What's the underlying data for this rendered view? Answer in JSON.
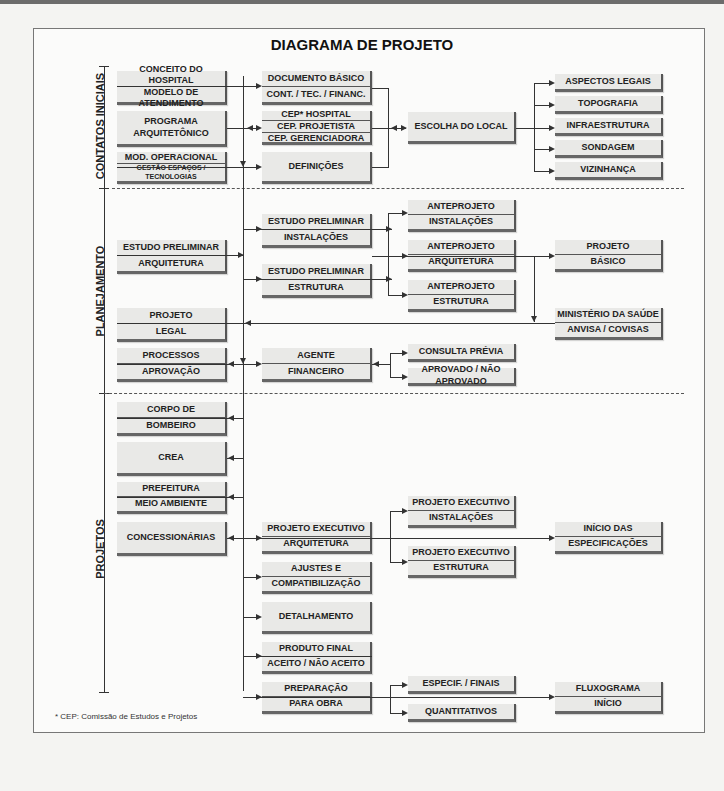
{
  "title": "DIAGRAMA DE PROJETO",
  "phases": [
    {
      "label": "CONTATOS INICIAIS"
    },
    {
      "label": "PLANEJAMENTO"
    },
    {
      "label": "PROJETOS"
    }
  ],
  "boxes": {
    "conceito": [
      "CONCEITO DO HOSPITAL",
      "MODELO DE ATENDIMENTO"
    ],
    "programa": [
      "PROGRAMA",
      "ARQUITETÔNICO"
    ],
    "mod_operacional": [
      "MOD. OPERACIONAL",
      "GESTÃO ESPAÇOS / TECNOLOGIAS"
    ],
    "documento_basico": [
      "DOCUMENTO BÁSICO",
      "CONT. / TEC. / FINANC."
    ],
    "cep": [
      "CEP* HOSPITAL",
      "CEP. PROJETISTA",
      "CEP. GERENCIADORA"
    ],
    "definicoes": [
      "DEFINIÇÕES"
    ],
    "escolha_local": [
      "ESCOLHA DO LOCAL"
    ],
    "aspectos_legais": [
      "ASPECTOS LEGAIS"
    ],
    "topografia": [
      "TOPOGRAFIA"
    ],
    "infraestrutura": [
      "INFRAESTRUTURA"
    ],
    "sondagem": [
      "SONDAGEM"
    ],
    "vizinhanca": [
      "VIZINHANÇA"
    ],
    "ep_arquitetura": [
      "ESTUDO PRELIMINAR",
      "ARQUITETURA"
    ],
    "ep_instalacoes": [
      "ESTUDO PRELIMINAR",
      "INSTALAÇÕES"
    ],
    "ep_estrutura": [
      "ESTUDO PRELIMINAR",
      "ESTRUTURA"
    ],
    "ap_instalacoes": [
      "ANTEPROJETO",
      "INSTALAÇÕES"
    ],
    "ap_arquitetura": [
      "ANTEPROJETO",
      "ARQUITETURA"
    ],
    "ap_estrutura": [
      "ANTEPROJETO",
      "ESTRUTURA"
    ],
    "projeto_basico": [
      "PROJETO",
      "BÁSICO"
    ],
    "ministerio": [
      "MINISTÉRIO DA SAÚDE",
      "ANVISA / COVISAS"
    ],
    "projeto_legal": [
      "PROJETO",
      "LEGAL"
    ],
    "processos": [
      "PROCESSOS",
      "APROVAÇÃO"
    ],
    "agente": [
      "AGENTE",
      "FINANCEIRO"
    ],
    "consulta_previa": [
      "CONSULTA PRÉVIA"
    ],
    "aprovado": [
      "APROVADO / NÃO APROVADO"
    ],
    "corpo_bombeiro": [
      "CORPO DE",
      "BOMBEIRO"
    ],
    "crea": [
      "CREA"
    ],
    "prefeitura": [
      "PREFEITURA",
      "MEIO AMBIENTE"
    ],
    "concessionarias": [
      "CONCESSIONÁRIAS"
    ],
    "pe_arquitetura": [
      "PROJETO EXECUTIVO",
      "ARQUITETURA"
    ],
    "pe_instalacoes": [
      "PROJETO EXECUTIVO",
      "INSTALAÇÕES"
    ],
    "pe_estrutura": [
      "PROJETO EXECUTIVO",
      "ESTRUTURA"
    ],
    "inicio_especificacoes": [
      "INÍCIO DAS",
      "ESPECIFICAÇÕES"
    ],
    "ajustes": [
      "AJUSTES E",
      "COMPATIBILIZAÇÃO"
    ],
    "detalhamento": [
      "DETALHAMENTO"
    ],
    "produto_final": [
      "PRODUTO FINAL",
      "ACEITO / NÃO ACEITO"
    ],
    "preparacao": [
      "PREPARAÇÃO",
      "PARA OBRA"
    ],
    "especif_finais": [
      "ESPECIF. / FINAIS"
    ],
    "quantitativos": [
      "QUANTITATIVOS"
    ],
    "fluxograma": [
      "FLUXOGRAMA",
      "INÍCIO"
    ]
  },
  "footnote": "* CEP: Comissão de Estudos e Projetos"
}
